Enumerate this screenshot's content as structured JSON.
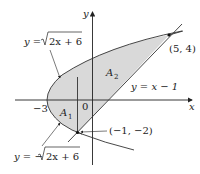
{
  "diagram": {
    "type": "region-between-curves",
    "axes": {
      "x_label": "x",
      "y_label": "y",
      "origin_label": "0"
    },
    "curves": [
      {
        "id": "upper",
        "label": "y = √(2x + 6)",
        "label_prefix": "y = ",
        "radicand": "2x + 6"
      },
      {
        "id": "lower",
        "label": "y = −√(2x + 6)",
        "label_prefix": "y = −",
        "radicand": "2x + 6"
      },
      {
        "id": "line",
        "label": "y = x − 1"
      }
    ],
    "points": [
      {
        "label": "(5, 4)",
        "x": 5,
        "y": 4
      },
      {
        "label": "(−1, −2)",
        "x": -1,
        "y": -2
      }
    ],
    "tick_labels": {
      "x_minus_3": "−3"
    },
    "regions": [
      {
        "name": "A",
        "sub": "1"
      },
      {
        "name": "A",
        "sub": "2"
      }
    ],
    "colors": {
      "shade": "#d9d9d9",
      "stroke": "#333333"
    }
  }
}
